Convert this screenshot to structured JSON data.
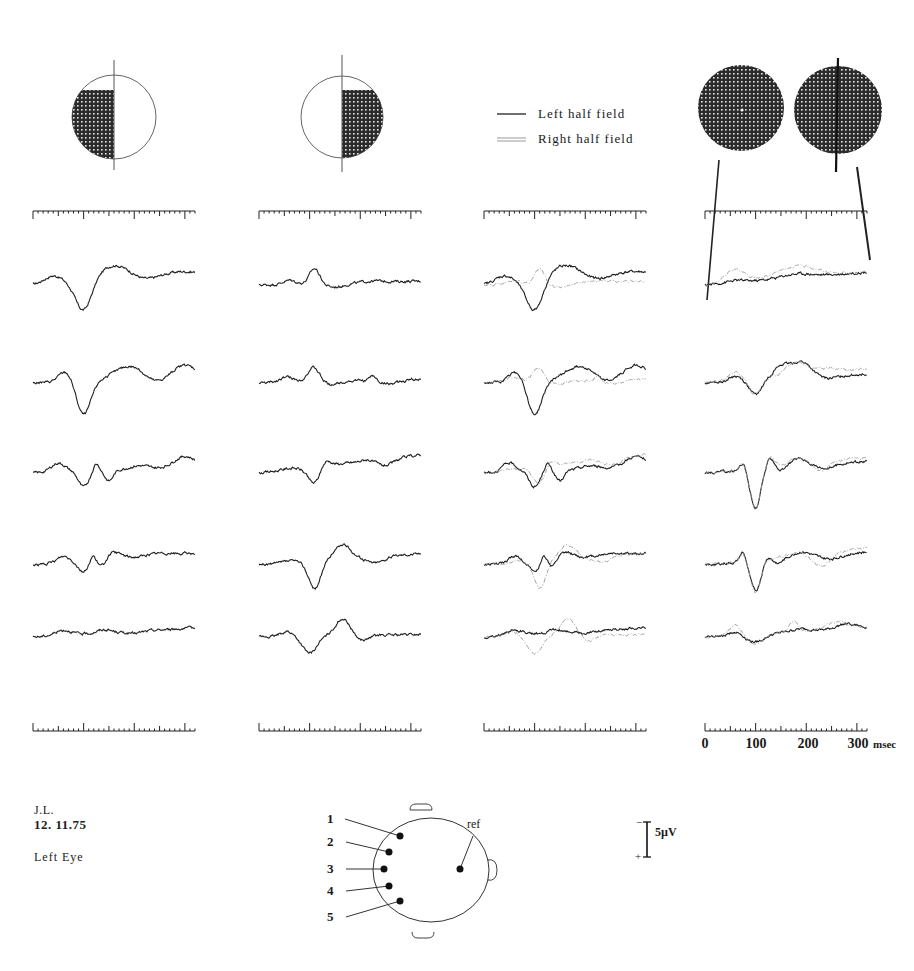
{
  "chart_data": {
    "type": "line",
    "title": "",
    "xlabel": "msec",
    "ylabel": "µV",
    "x_range_ms": [
      0,
      320
    ],
    "time_axis_ticks": [
      0,
      100,
      200,
      300
    ],
    "time_axis_unit": "msec",
    "minor_tick_ms": 10,
    "major_tick_ms": 50,
    "scale_bar": {
      "value": 5,
      "unit": "µV",
      "label": "5µV",
      "top_sign": "−",
      "bottom_sign": "+"
    },
    "legend": [
      {
        "name": "Left half field",
        "style": "solid-dark"
      },
      {
        "name": "Right half field",
        "style": "double-light"
      }
    ],
    "columns": [
      {
        "name": "left-half-field",
        "stimulus": "left-half",
        "series": [
          "left"
        ]
      },
      {
        "name": "right-half-field",
        "stimulus": "right-half",
        "series": [
          "right"
        ]
      },
      {
        "name": "superimposed",
        "stimulus": "legend",
        "series": [
          "left",
          "right"
        ]
      },
      {
        "name": "full-field",
        "stimulus": "full-field",
        "series": [
          "full",
          "fullRight"
        ]
      }
    ],
    "channels": [
      1,
      2,
      3,
      4,
      5
    ],
    "series": {
      "left": [
        {
          "channel": 1,
          "components": [
            [
              40,
              1.2,
              18
            ],
            [
              100,
              -4.6,
              16
            ],
            [
              160,
              2.2,
              30
            ],
            [
              220,
              -0.4,
              20
            ],
            [
              290,
              0.6,
              30
            ]
          ],
          "drift": 1.6
        },
        {
          "channel": 2,
          "components": [
            [
              65,
              1.6,
              14
            ],
            [
              100,
              -5.2,
              14
            ],
            [
              190,
              2.0,
              28
            ],
            [
              240,
              -0.8,
              18
            ],
            [
              300,
              1.8,
              22
            ]
          ],
          "drift": 1.0
        },
        {
          "channel": 3,
          "components": [
            [
              50,
              1.4,
              14
            ],
            [
              100,
              -2.4,
              10
            ],
            [
              125,
              1.2,
              6
            ],
            [
              150,
              -1.6,
              8
            ],
            [
              210,
              0.6,
              20
            ],
            [
              300,
              1.8,
              22
            ]
          ],
          "drift": 0.8
        },
        {
          "channel": 4,
          "components": [
            [
              60,
              1.0,
              12
            ],
            [
              100,
              -1.6,
              10
            ],
            [
              118,
              1.0,
              6
            ],
            [
              136,
              -1.2,
              8
            ],
            [
              160,
              1.0,
              16
            ],
            [
              250,
              0.4,
              25
            ]
          ],
          "drift": 1.8
        },
        {
          "channel": 5,
          "components": [
            [
              60,
              0.8,
              16
            ],
            [
              140,
              0.5,
              14
            ],
            [
              200,
              -0.3,
              16
            ]
          ],
          "drift": 1.4
        }
      ],
      "right": [
        {
          "channel": 1,
          "components": [
            [
              60,
              0.6,
              12
            ],
            [
              110,
              2.4,
              10
            ],
            [
              150,
              -0.6,
              20
            ],
            [
              230,
              0.2,
              20
            ]
          ],
          "drift": 0.6
        },
        {
          "channel": 2,
          "components": [
            [
              55,
              0.8,
              14
            ],
            [
              108,
              2.2,
              12
            ],
            [
              140,
              -0.5,
              18
            ],
            [
              225,
              0.8,
              6
            ],
            [
              260,
              -0.6,
              20
            ]
          ],
          "drift": 0.6
        },
        {
          "channel": 3,
          "components": [
            [
              60,
              0.2,
              14
            ],
            [
              110,
              -2.6,
              13
            ],
            [
              130,
              1.2,
              10
            ],
            [
              215,
              0.3,
              10
            ],
            [
              250,
              -1.0,
              18
            ]
          ],
          "drift": 2.8
        },
        {
          "channel": 4,
          "components": [
            [
              60,
              0.3,
              14
            ],
            [
              110,
              -4.2,
              12
            ],
            [
              165,
              2.2,
              16
            ],
            [
              230,
              -0.9,
              18
            ]
          ],
          "drift": 1.8
        },
        {
          "channel": 5,
          "components": [
            [
              55,
              0.8,
              12
            ],
            [
              100,
              -2.6,
              14
            ],
            [
              165,
              2.6,
              14
            ],
            [
              205,
              -0.8,
              12
            ]
          ],
          "drift": 0.4
        }
      ],
      "full": [
        {
          "channel": 1,
          "components": [
            [
              60,
              0.3,
              20
            ],
            [
              180,
              0.6,
              30
            ]
          ],
          "drift": 2.0
        },
        {
          "channel": 2,
          "components": [
            [
              60,
              0.8,
              12
            ],
            [
              100,
              -2.2,
              12
            ],
            [
              150,
              1.8,
              16
            ],
            [
              190,
              2.4,
              20
            ],
            [
              240,
              -0.4,
              20
            ]
          ],
          "drift": 1.4
        },
        {
          "channel": 3,
          "components": [
            [
              75,
              1.2,
              6
            ],
            [
              100,
              -6.0,
              10
            ],
            [
              130,
              1.6,
              8
            ],
            [
              150,
              -0.6,
              10
            ],
            [
              185,
              1.2,
              16
            ],
            [
              240,
              -0.6,
              16
            ]
          ],
          "drift": 1.8
        },
        {
          "channel": 4,
          "components": [
            [
              75,
              1.6,
              6
            ],
            [
              100,
              -4.6,
              10
            ],
            [
              125,
              0.6,
              6
            ],
            [
              145,
              -0.6,
              10
            ],
            [
              190,
              0.8,
              18
            ],
            [
              250,
              -0.6,
              20
            ]
          ],
          "drift": 2.0
        },
        {
          "channel": 5,
          "components": [
            [
              60,
              0.6,
              12
            ],
            [
              100,
              -1.2,
              18
            ],
            [
              190,
              0.4,
              20
            ],
            [
              280,
              0.8,
              20
            ]
          ],
          "drift": 1.4
        }
      ],
      "fullRight": [
        {
          "channel": 1,
          "components": [
            [
              60,
              2.0,
              20
            ],
            [
              180,
              1.8,
              40
            ]
          ],
          "drift": 2.0
        },
        {
          "channel": 2,
          "components": [
            [
              60,
              1.2,
              14
            ],
            [
              100,
              -2.4,
              12
            ],
            [
              180,
              2.0,
              20
            ],
            [
              240,
              0.6,
              20
            ]
          ],
          "drift": 2.2
        },
        {
          "channel": 3,
          "components": [
            [
              75,
              1.0,
              6
            ],
            [
              100,
              -6.3,
              10
            ],
            [
              130,
              1.4,
              8
            ],
            [
              185,
              0.8,
              16
            ],
            [
              230,
              -1.4,
              14
            ]
          ],
          "drift": 2.4
        },
        {
          "channel": 4,
          "components": [
            [
              75,
              1.4,
              6
            ],
            [
              100,
              -5.0,
              10
            ],
            [
              185,
              0.4,
              18
            ],
            [
              230,
              -2.0,
              18
            ]
          ],
          "drift": 2.6
        },
        {
          "channel": 5,
          "components": [
            [
              60,
              1.6,
              12
            ],
            [
              100,
              -1.6,
              16
            ],
            [
              175,
              1.6,
              8
            ],
            [
              260,
              1.0,
              20
            ]
          ],
          "drift": 1.6
        }
      ]
    }
  },
  "meta": {
    "subject": "J.L.",
    "date": "12. 11.75",
    "eye": "Left  Eye"
  },
  "head_diagram": {
    "electrodes": [
      "1",
      "2",
      "3",
      "4",
      "5"
    ],
    "reference_label": "ref"
  },
  "colors": {
    "ink": "#1f1f1f",
    "light_trace": "#9a9a9a",
    "pattern": "#2b2b2b"
  }
}
